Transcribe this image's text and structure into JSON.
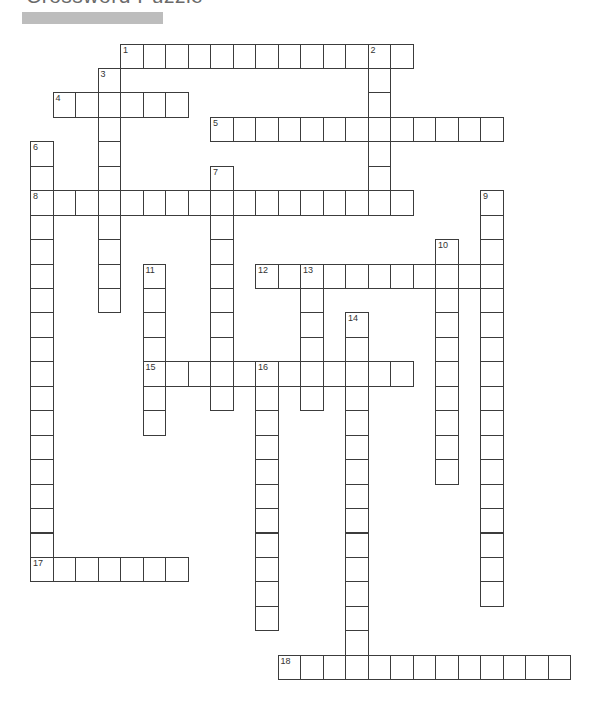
{
  "page": {
    "title": "Crossword Puzzle"
  },
  "grid": {
    "origin_x": 30.5,
    "origin_y": 44,
    "cell_w": 22.5,
    "cell_h": 24.45,
    "line_color": "#3c3c3c"
  },
  "entries": [
    {
      "number": "1",
      "direction": "across",
      "row": 0,
      "col": 4,
      "length": 13
    },
    {
      "number": "2",
      "direction": "down",
      "row": 0,
      "col": 15,
      "length": 7
    },
    {
      "number": "3",
      "direction": "down",
      "row": 1,
      "col": 3,
      "length": 10
    },
    {
      "number": "4",
      "direction": "across",
      "row": 2,
      "col": 1,
      "length": 6
    },
    {
      "number": "5",
      "direction": "across",
      "row": 3,
      "col": 8,
      "length": 13
    },
    {
      "number": "6",
      "direction": "down",
      "row": 4,
      "col": 0,
      "length": 18
    },
    {
      "number": "7",
      "direction": "down",
      "row": 5,
      "col": 8,
      "length": 10
    },
    {
      "number": "8",
      "direction": "across",
      "row": 6,
      "col": 0,
      "length": 17
    },
    {
      "number": "9",
      "direction": "down",
      "row": 6,
      "col": 20,
      "length": 17
    },
    {
      "number": "10",
      "direction": "down",
      "row": 8,
      "col": 18,
      "length": 10
    },
    {
      "number": "11",
      "direction": "down",
      "row": 9,
      "col": 5,
      "length": 7
    },
    {
      "number": "12",
      "direction": "across",
      "row": 9,
      "col": 10,
      "length": 11
    },
    {
      "number": "13",
      "direction": "down",
      "row": 9,
      "col": 12,
      "length": 6
    },
    {
      "number": "14",
      "direction": "down",
      "row": 11,
      "col": 14,
      "length": 15
    },
    {
      "number": "15",
      "direction": "across",
      "row": 13,
      "col": 5,
      "length": 12
    },
    {
      "number": "16",
      "direction": "down",
      "row": 13,
      "col": 10,
      "length": 11
    },
    {
      "number": "17",
      "direction": "across",
      "row": 21,
      "col": 0,
      "length": 7
    },
    {
      "number": "18",
      "direction": "across",
      "row": 25,
      "col": 11,
      "length": 13
    }
  ]
}
